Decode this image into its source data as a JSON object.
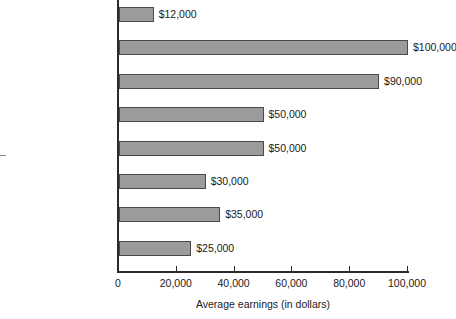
{
  "chart_data": {
    "type": "bar",
    "orientation": "horizontal",
    "title": "",
    "xlabel": "Average earnings (in dollars)",
    "ylabel": "",
    "xlim": [
      0,
      100000
    ],
    "grid": false,
    "legend": null,
    "categories": [
      "All workers",
      "Physicians",
      "Attorneys",
      "Physician assistants",
      "Nurse practitioners",
      "Nurses",
      "Teachers",
      "Secretaries"
    ],
    "values": [
      12000,
      100000,
      90000,
      50000,
      50000,
      30000,
      35000,
      25000
    ],
    "data_labels": [
      "$12,000",
      "$100,000",
      "$90,000",
      "$50,000",
      "$50,000",
      "$30,000",
      "$35,000",
      "$25,000"
    ],
    "xticks": [
      0,
      20000,
      40000,
      60000,
      80000,
      100000
    ],
    "xtick_labels": [
      "0",
      "20,000",
      "40,000",
      "60,000",
      "80,000",
      "100,000"
    ],
    "bar_color": "#9b9b9b",
    "bar_border_color": "#4a4a4a",
    "axis_color": "#2b2b2b",
    "background": "#ffffff"
  }
}
